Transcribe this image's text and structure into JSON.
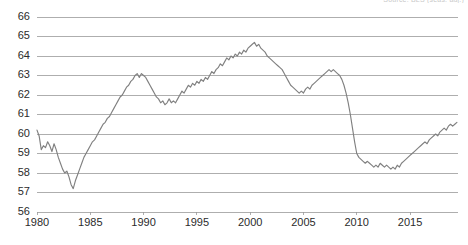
{
  "corner_note": "Source: BLS (seas. adj.)",
  "chart_data": {
    "type": "line",
    "title": "",
    "subtitle": "",
    "xlabel": "",
    "ylabel": "",
    "xlim": [
      1980,
      2019.5
    ],
    "ylim": [
      56,
      66
    ],
    "grid": true,
    "legend": false,
    "legend_position": "none",
    "line_color": "#808080",
    "grid_color": "#9a9a9a",
    "background_color": "#ffffff",
    "text_color": "#2b2b2b",
    "y_ticks": [
      56,
      57,
      58,
      59,
      60,
      61,
      62,
      63,
      64,
      65,
      66
    ],
    "y_tick_labels": [
      "56",
      "57",
      "58",
      "59",
      "60",
      "61",
      "62",
      "63",
      "64",
      "65",
      "66"
    ],
    "x_ticks": [
      1980,
      1985,
      1990,
      1995,
      2000,
      2005,
      2010,
      2015
    ],
    "x_tick_labels": [
      "1980",
      "1985",
      "1990",
      "1995",
      "2000",
      "2005",
      "2010",
      "2015"
    ],
    "series": [
      {
        "name": "Labor force participation rate",
        "x": [
          1980.0,
          1980.2,
          1980.4,
          1980.6,
          1980.8,
          1981.0,
          1981.2,
          1981.4,
          1981.6,
          1981.8,
          1982.0,
          1982.2,
          1982.4,
          1982.6,
          1982.8,
          1983.0,
          1983.2,
          1983.4,
          1983.6,
          1983.8,
          1984.0,
          1984.2,
          1984.4,
          1984.6,
          1984.8,
          1985.0,
          1985.2,
          1985.4,
          1985.6,
          1985.8,
          1986.0,
          1986.2,
          1986.4,
          1986.6,
          1986.8,
          1987.0,
          1987.2,
          1987.4,
          1987.6,
          1987.8,
          1988.0,
          1988.2,
          1988.4,
          1988.6,
          1988.8,
          1989.0,
          1989.2,
          1989.4,
          1989.6,
          1989.8,
          1990.0,
          1990.2,
          1990.4,
          1990.6,
          1990.8,
          1991.0,
          1991.2,
          1991.4,
          1991.6,
          1991.8,
          1992.0,
          1992.2,
          1992.4,
          1992.6,
          1992.8,
          1993.0,
          1993.2,
          1993.4,
          1993.6,
          1993.8,
          1994.0,
          1994.2,
          1994.4,
          1994.6,
          1994.8,
          1995.0,
          1995.2,
          1995.4,
          1995.6,
          1995.8,
          1996.0,
          1996.2,
          1996.4,
          1996.6,
          1996.8,
          1997.0,
          1997.2,
          1997.4,
          1997.6,
          1997.8,
          1998.0,
          1998.2,
          1998.4,
          1998.6,
          1998.8,
          1999.0,
          1999.2,
          1999.4,
          1999.6,
          1999.8,
          2000.0,
          2000.2,
          2000.4,
          2000.6,
          2000.8,
          2001.0,
          2001.2,
          2001.4,
          2001.6,
          2001.8,
          2002.0,
          2002.2,
          2002.4,
          2002.6,
          2002.8,
          2003.0,
          2003.2,
          2003.4,
          2003.6,
          2003.8,
          2004.0,
          2004.2,
          2004.4,
          2004.6,
          2004.8,
          2005.0,
          2005.2,
          2005.4,
          2005.6,
          2005.8,
          2006.0,
          2006.2,
          2006.4,
          2006.6,
          2006.8,
          2007.0,
          2007.2,
          2007.4,
          2007.6,
          2007.8,
          2008.0,
          2008.2,
          2008.4,
          2008.6,
          2008.8,
          2009.0,
          2009.2,
          2009.4,
          2009.6,
          2009.8,
          2010.0,
          2010.2,
          2010.4,
          2010.6,
          2010.8,
          2011.0,
          2011.2,
          2011.4,
          2011.6,
          2011.8,
          2012.0,
          2012.2,
          2012.4,
          2012.6,
          2012.8,
          2013.0,
          2013.2,
          2013.4,
          2013.6,
          2013.8,
          2014.0,
          2014.2,
          2014.4,
          2014.6,
          2014.8,
          2015.0,
          2015.2,
          2015.4,
          2015.6,
          2015.8,
          2016.0,
          2016.2,
          2016.4,
          2016.6,
          2016.8,
          2017.0,
          2017.2,
          2017.4,
          2017.6,
          2017.8,
          2018.0,
          2018.2,
          2018.4,
          2018.6,
          2018.8,
          2019.0,
          2019.2,
          2019.4
        ],
        "values": [
          60.2,
          59.9,
          59.2,
          59.4,
          59.3,
          59.6,
          59.4,
          59.1,
          59.5,
          59.2,
          58.8,
          58.5,
          58.2,
          58.0,
          58.1,
          57.8,
          57.4,
          57.2,
          57.6,
          57.9,
          58.2,
          58.5,
          58.8,
          59.0,
          59.2,
          59.4,
          59.6,
          59.7,
          59.9,
          60.1,
          60.3,
          60.5,
          60.6,
          60.8,
          60.9,
          61.1,
          61.3,
          61.5,
          61.7,
          61.9,
          62.0,
          62.2,
          62.4,
          62.5,
          62.7,
          62.8,
          63.0,
          63.1,
          62.9,
          63.1,
          63.0,
          62.9,
          62.7,
          62.5,
          62.3,
          62.1,
          61.9,
          61.8,
          61.6,
          61.7,
          61.5,
          61.6,
          61.8,
          61.6,
          61.7,
          61.6,
          61.8,
          62.0,
          62.2,
          62.1,
          62.3,
          62.5,
          62.4,
          62.6,
          62.5,
          62.7,
          62.6,
          62.8,
          62.7,
          62.9,
          62.8,
          63.0,
          63.2,
          63.1,
          63.3,
          63.4,
          63.6,
          63.5,
          63.7,
          63.9,
          63.8,
          64.0,
          63.9,
          64.1,
          64.0,
          64.2,
          64.1,
          64.3,
          64.2,
          64.4,
          64.5,
          64.6,
          64.7,
          64.5,
          64.6,
          64.4,
          64.3,
          64.2,
          64.0,
          63.9,
          63.8,
          63.7,
          63.6,
          63.5,
          63.4,
          63.3,
          63.1,
          62.9,
          62.7,
          62.5,
          62.4,
          62.3,
          62.2,
          62.1,
          62.2,
          62.1,
          62.3,
          62.4,
          62.3,
          62.5,
          62.6,
          62.7,
          62.8,
          62.9,
          63.0,
          63.1,
          63.2,
          63.3,
          63.2,
          63.3,
          63.2,
          63.1,
          63.0,
          62.8,
          62.5,
          62.1,
          61.6,
          61.0,
          60.3,
          59.6,
          59.0,
          58.8,
          58.7,
          58.6,
          58.5,
          58.6,
          58.5,
          58.4,
          58.3,
          58.4,
          58.3,
          58.5,
          58.4,
          58.3,
          58.4,
          58.3,
          58.2,
          58.3,
          58.2,
          58.4,
          58.3,
          58.5,
          58.6,
          58.7,
          58.8,
          58.9,
          59.0,
          59.1,
          59.2,
          59.3,
          59.4,
          59.5,
          59.6,
          59.5,
          59.7,
          59.8,
          59.9,
          60.0,
          59.9,
          60.1,
          60.2,
          60.3,
          60.2,
          60.4,
          60.5,
          60.4,
          60.5,
          60.6
        ]
      }
    ],
    "annotations": [
      {
        "label": "1983 trough",
        "x": 1983.4,
        "y": 57.2
      },
      {
        "label": "1989-1990 local peak",
        "x": 1989.4,
        "y": 63.1
      },
      {
        "label": "1992 dip",
        "x": 1992.0,
        "y": 61.5
      },
      {
        "label": "2000 peak",
        "x": 2000.4,
        "y": 64.7
      },
      {
        "label": "2005 trough",
        "x": 2004.6,
        "y": 62.1
      },
      {
        "label": "2007 local peak",
        "x": 2007.4,
        "y": 63.3
      },
      {
        "label": "2013 trough",
        "x": 2013.2,
        "y": 58.2
      },
      {
        "label": "2019 end",
        "x": 2019.4,
        "y": 60.6
      }
    ]
  }
}
